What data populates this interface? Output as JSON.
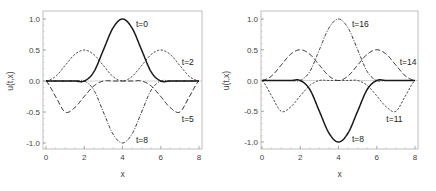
{
  "chart_data": [
    {
      "type": "line",
      "title": "",
      "xlabel": "x",
      "ylabel": "u(t,x)",
      "xlim": [
        0,
        8
      ],
      "ylim": [
        -1.1,
        1.1
      ],
      "xticks": [
        "0",
        "2",
        "4",
        "6",
        "8"
      ],
      "yticks": [
        "1.0",
        "0.5",
        "0.0",
        "-0.5",
        "-1.0"
      ],
      "grid": false,
      "legend": "inline labels",
      "x": [
        0,
        0.5,
        1,
        1.5,
        2,
        2.5,
        3,
        3.5,
        4,
        4.5,
        5,
        5.5,
        6,
        6.5,
        7,
        7.5,
        8
      ],
      "series": [
        {
          "name": "t=0",
          "style": "solid",
          "values": [
            0,
            0,
            0,
            0,
            0,
            0.146,
            0.5,
            0.854,
            1.0,
            0.854,
            0.5,
            0.146,
            0,
            0,
            0,
            0,
            0
          ]
        },
        {
          "name": "t=2",
          "style": "short-dash",
          "values": [
            0,
            0.073,
            0.25,
            0.427,
            0.5,
            0.427,
            0.25,
            0.073,
            0,
            0.073,
            0.25,
            0.427,
            0.5,
            0.427,
            0.25,
            0.073,
            0
          ]
        },
        {
          "name": "t=5",
          "style": "long-dash",
          "values": [
            0,
            -0.25,
            -0.5,
            -0.43,
            -0.25,
            -0.08,
            0,
            0,
            0,
            0,
            0,
            -0.08,
            -0.25,
            -0.43,
            -0.5,
            -0.25,
            0
          ]
        },
        {
          "name": "t=8",
          "style": "dash-dot",
          "values": [
            0,
            0,
            0,
            0,
            0,
            -0.146,
            -0.5,
            -0.854,
            -1.0,
            -0.854,
            -0.5,
            -0.146,
            0,
            0,
            0,
            0,
            0
          ]
        }
      ],
      "labels": [
        {
          "text": "t=0",
          "x": 4.7,
          "y": 0.92
        },
        {
          "text": "t=2",
          "x": 7.1,
          "y": 0.3
        },
        {
          "text": "t=5",
          "x": 7.1,
          "y": -0.62
        },
        {
          "text": "t=8",
          "x": 4.7,
          "y": -0.95
        }
      ]
    },
    {
      "type": "line",
      "title": "",
      "xlabel": "x",
      "ylabel": "u(t,x)",
      "xlim": [
        0,
        8
      ],
      "ylim": [
        -1.1,
        1.1
      ],
      "xticks": [
        "0",
        "2",
        "4",
        "6",
        "8"
      ],
      "yticks": [
        "1.0",
        "0.5",
        "0.0",
        "-0.5",
        "-1.0"
      ],
      "grid": false,
      "legend": "inline labels",
      "x": [
        0,
        0.5,
        1,
        1.5,
        2,
        2.5,
        3,
        3.5,
        4,
        4.5,
        5,
        5.5,
        6,
        6.5,
        7,
        7.5,
        8
      ],
      "series": [
        {
          "name": "t=8",
          "style": "solid",
          "values": [
            0,
            0,
            0,
            0,
            0,
            -0.146,
            -0.5,
            -0.854,
            -1.0,
            -0.854,
            -0.5,
            -0.146,
            0,
            0,
            0,
            0,
            0
          ]
        },
        {
          "name": "t=11",
          "style": "short-dash",
          "values": [
            0,
            -0.25,
            -0.5,
            -0.43,
            -0.25,
            -0.08,
            0,
            0,
            0,
            0,
            0,
            -0.08,
            -0.25,
            -0.43,
            -0.5,
            -0.25,
            0
          ]
        },
        {
          "name": "t=14",
          "style": "long-dash",
          "values": [
            0,
            0.073,
            0.25,
            0.427,
            0.5,
            0.427,
            0.25,
            0.073,
            0,
            0.073,
            0.25,
            0.427,
            0.5,
            0.427,
            0.25,
            0.073,
            0
          ]
        },
        {
          "name": "t=16",
          "style": "dash-dot",
          "values": [
            0,
            0,
            0,
            0,
            0,
            0.146,
            0.5,
            0.854,
            1.0,
            0.854,
            0.5,
            0.146,
            0,
            0,
            0,
            0,
            0
          ]
        }
      ],
      "labels": [
        {
          "text": "t=16",
          "x": 4.7,
          "y": 0.92
        },
        {
          "text": "t=14",
          "x": 7.2,
          "y": 0.3
        },
        {
          "text": "t=11",
          "x": 6.5,
          "y": -0.62
        },
        {
          "text": "t=8",
          "x": 4.7,
          "y": -0.95
        }
      ]
    }
  ],
  "panels": [
    {
      "ylabel": "u(t,x)",
      "xlabel": "x"
    },
    {
      "ylabel": "u(t,x)",
      "xlabel": "x"
    }
  ],
  "colors": {
    "curve": "#1a1a1a",
    "frame": "#b0b0b0",
    "zero_line": "#c8c8c8",
    "text": "#444444"
  }
}
